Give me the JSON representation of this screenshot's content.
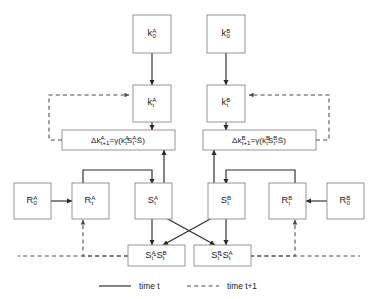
{
  "figure": {
    "type": "flow-diagram",
    "title": "",
    "background": "#ffffff",
    "stroke_solid": "#2b2b2b",
    "stroke_dashed": "#4a4a4a",
    "box_stroke": "#8a8a8a"
  },
  "nodes": {
    "kA0": {
      "base": "k",
      "sup": "A",
      "sub": "0",
      "label": "kA0"
    },
    "kB0": {
      "base": "k",
      "sup": "B",
      "sub": "0",
      "label": "kB0"
    },
    "kAt": {
      "base": "k",
      "sup": "A",
      "sub": "t",
      "label": "kAt"
    },
    "kBt": {
      "base": "k",
      "sup": "B",
      "sub": "t",
      "label": "kBt"
    },
    "RA0": {
      "base": "R",
      "sup": "A",
      "sub": "0",
      "label": "RA0"
    },
    "RB0": {
      "base": "R",
      "sup": "B",
      "sub": "0",
      "label": "RB0"
    },
    "RAt": {
      "base": "R",
      "sup": "A",
      "sub": "t",
      "label": "RAt"
    },
    "RBt": {
      "base": "R",
      "sup": "B",
      "sub": "t",
      "label": "RBt"
    },
    "SAt": {
      "base": "S",
      "sup": "A",
      "sub": "t",
      "label": "SAt"
    },
    "SBt": {
      "base": "S",
      "sup": "B",
      "sub": "t",
      "label": "SBt"
    }
  },
  "equations": {
    "deltaA": {
      "parts": [
        {
          "t": "Δk",
          "k": "n"
        },
        {
          "t": "A",
          "k": "sup"
        },
        {
          "t": "t+1",
          "k": "sub"
        },
        {
          "t": "=γ(k",
          "k": "n"
        },
        {
          "t": "A",
          "k": "sup"
        },
        {
          "t": "t",
          "k": "sub"
        },
        {
          "t": "S",
          "k": "n"
        },
        {
          "t": "A",
          "k": "sup"
        },
        {
          "t": "t",
          "k": "sub"
        },
        {
          "t": "-S̄)",
          "k": "n"
        }
      ],
      "plain": "Δk^A_t+1 = γ(k^A_t S^A_t - S̄)"
    },
    "deltaB": {
      "parts": [
        {
          "t": "Δk",
          "k": "n"
        },
        {
          "t": "B",
          "k": "sup"
        },
        {
          "t": "t+1",
          "k": "sub"
        },
        {
          "t": "=γ(k",
          "k": "n"
        },
        {
          "t": "B",
          "k": "sup"
        },
        {
          "t": "t",
          "k": "sub"
        },
        {
          "t": "S",
          "k": "n"
        },
        {
          "t": "B",
          "k": "sup"
        },
        {
          "t": "t",
          "k": "sub"
        },
        {
          "t": "-S̄)",
          "k": "n"
        }
      ],
      "plain": "Δk^B_t+1 = γ(k^B_t S^B_t - S̄)"
    },
    "diffAB": {
      "parts": [
        {
          "t": "S",
          "k": "n"
        },
        {
          "t": "A",
          "k": "sup"
        },
        {
          "t": "t",
          "k": "sub"
        },
        {
          "t": "-S",
          "k": "n"
        },
        {
          "t": "B",
          "k": "sup"
        },
        {
          "t": "t",
          "k": "sub"
        }
      ],
      "plain": "S^A_t - S^B_t"
    },
    "diffBA": {
      "parts": [
        {
          "t": "S",
          "k": "n"
        },
        {
          "t": "B",
          "k": "sup"
        },
        {
          "t": "t",
          "k": "sub"
        },
        {
          "t": "-S",
          "k": "n"
        },
        {
          "t": "A",
          "k": "sup"
        },
        {
          "t": "t",
          "k": "sub"
        }
      ],
      "plain": "S^B_t - S^A_t"
    }
  },
  "legend": {
    "items": [
      {
        "style": "solid",
        "label": "time t"
      },
      {
        "style": "dashed",
        "label": "time t+1"
      }
    ]
  }
}
